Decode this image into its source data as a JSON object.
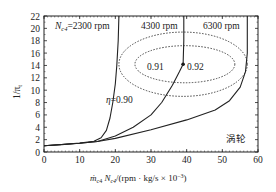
{
  "chart_data": {
    "type": "line",
    "title": "",
    "xlabel": "ṁc4 Nc4/(rpm · kg/s × 10⁻³)",
    "xlabel_parts": {
      "m": "ṁ",
      "m_sub": "c4",
      "n": " N",
      "n_sub": "c4",
      "rest": "/(rpm · kg/s × 10",
      "exp": "−3",
      "close": ")"
    },
    "ylabel": "1/πt",
    "ylabel_parts": {
      "main": "1/π",
      "sub": "t"
    },
    "xlim": [
      0,
      60
    ],
    "ylim": [
      0,
      22
    ],
    "xticks": [
      0,
      10,
      20,
      30,
      40,
      50,
      60
    ],
    "yticks": [
      0,
      2,
      4,
      6,
      8,
      10,
      12,
      14,
      16,
      18,
      20,
      22
    ],
    "grid": false,
    "legend": null,
    "series": [
      {
        "name": "Nc4=2300 rpm",
        "style": "solid",
        "x": [
          0,
          5,
          10,
          14,
          16,
          17.5,
          18.5,
          19.3,
          20,
          20.4,
          20.8,
          21
        ],
        "y": [
          1.0,
          1.2,
          1.45,
          1.75,
          2.3,
          3.5,
          5.5,
          8,
          11,
          14,
          18,
          22
        ]
      },
      {
        "name": "4300 rpm",
        "style": "solid",
        "x": [
          0,
          10,
          15,
          20,
          25,
          30,
          33,
          36,
          38,
          39,
          39.2,
          39.2
        ],
        "y": [
          1.0,
          1.4,
          1.7,
          2.6,
          4.0,
          6.0,
          8.0,
          10.8,
          13.0,
          14.2,
          18,
          22
        ]
      },
      {
        "name": "6300 rpm",
        "style": "solid",
        "x": [
          0,
          10,
          15,
          20,
          30,
          40,
          48,
          52,
          55,
          56.5,
          57,
          57
        ],
        "y": [
          1.0,
          1.4,
          1.7,
          2.2,
          3.6,
          5.2,
          6.8,
          8.3,
          10.5,
          13,
          16,
          22
        ]
      }
    ],
    "contours": [
      {
        "label": "η=0.90",
        "style": "dotted",
        "center": [
          39,
          14.2
        ],
        "rx": 18,
        "ry": 5.2
      },
      {
        "label": "0.91",
        "style": "dotted",
        "center": [
          39.5,
          14.2
        ],
        "rx": 14,
        "ry": 3.0
      },
      {
        "label": "0.92",
        "style": "point",
        "center": [
          39,
          14.2
        ]
      }
    ],
    "annotations": [
      {
        "text": "Nc4=2300 rpm",
        "x": 2,
        "y": 20.2
      },
      {
        "text": "4300 rpm",
        "x": 27,
        "y": 20.2
      },
      {
        "text": "6300 rpm",
        "x": 44.5,
        "y": 20.2
      },
      {
        "text": "η=0.90",
        "x": 22.5,
        "y": 8.5
      },
      {
        "text": "0.91",
        "x": 28.5,
        "y": 13.8
      },
      {
        "text": "0.92",
        "x": 39.8,
        "y": 13.8
      },
      {
        "text": "涡轮",
        "x": 52,
        "y": 2.3
      }
    ],
    "labels": {
      "n_prefix": "N",
      "n_sub": "c4",
      "n_rest": "=2300 rpm",
      "rpm4300": "4300 rpm",
      "rpm6300": "6300 rpm",
      "eta": "η",
      "eta_rest": "=0.90",
      "e091": "0.91",
      "e092": "0.92",
      "turbine": "涡轮"
    }
  }
}
